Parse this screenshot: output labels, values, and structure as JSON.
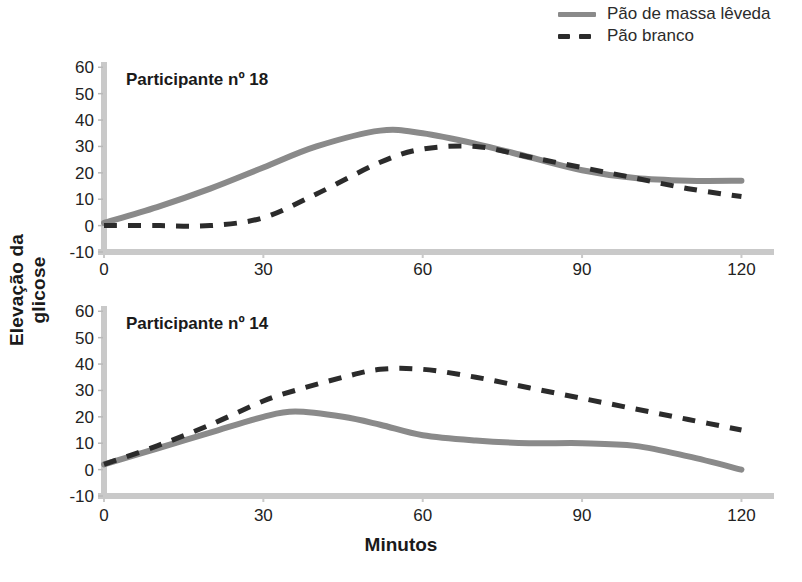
{
  "legend": {
    "position": "top-right",
    "items": [
      {
        "label": "Pão de massa lêveda",
        "style": "solid",
        "color": "#8a8a8a",
        "icon": "solid-line-swatch"
      },
      {
        "label": "Pão branco",
        "style": "dashed",
        "color": "#2b2b2b",
        "icon": "dashed-line-swatch"
      }
    ]
  },
  "axes": {
    "ylabel": "Elevação da glicose",
    "xlabel": "Minutos"
  },
  "chart_data": [
    {
      "type": "line",
      "title": "Participante nº 18",
      "xlabel": "Minutos",
      "ylabel": "Elevação da glicose",
      "xlim": [
        0,
        125
      ],
      "ylim": [
        -10,
        62
      ],
      "xticks": [
        0,
        30,
        60,
        90,
        120
      ],
      "yticks": [
        -10,
        0,
        10,
        20,
        30,
        40,
        50,
        60
      ],
      "grid": false,
      "legend": "top-right",
      "x": [
        0,
        10,
        20,
        30,
        40,
        52,
        60,
        70,
        80,
        90,
        100,
        110,
        120
      ],
      "series": [
        {
          "name": "Pão de massa lêveda",
          "style": "solid",
          "color": "#8a8a8a",
          "values": [
            1,
            7,
            14,
            22,
            30,
            36,
            35,
            31,
            26,
            21,
            18,
            17,
            17
          ]
        },
        {
          "name": "Pão branco",
          "style": "dashed",
          "color": "#2b2b2b",
          "values": [
            0,
            0,
            0,
            3,
            12,
            24,
            29,
            30,
            26,
            22,
            18,
            14,
            11
          ]
        }
      ]
    },
    {
      "type": "line",
      "title": "Participante nº 14",
      "xlabel": "Minutos",
      "ylabel": "Elevação da glicose",
      "xlim": [
        0,
        125
      ],
      "ylim": [
        -10,
        62
      ],
      "xticks": [
        0,
        30,
        60,
        90,
        120
      ],
      "yticks": [
        -10,
        0,
        10,
        20,
        30,
        40,
        50,
        60
      ],
      "grid": false,
      "legend": "top-right",
      "x": [
        0,
        10,
        20,
        30,
        36,
        45,
        52,
        60,
        70,
        80,
        90,
        100,
        110,
        120
      ],
      "series": [
        {
          "name": "Pão de massa lêveda",
          "style": "solid",
          "color": "#8a8a8a",
          "values": [
            2,
            8,
            14,
            20,
            22,
            20,
            17,
            13,
            11,
            10,
            10,
            9,
            5,
            0
          ]
        },
        {
          "name": "Pão branco",
          "style": "dashed",
          "color": "#2b2b2b",
          "values": [
            2,
            9,
            17,
            26,
            30,
            35,
            38,
            38,
            35,
            31,
            27,
            23,
            19,
            15
          ]
        }
      ]
    }
  ],
  "colors": {
    "solid_series": "#8a8a8a",
    "dashed_series": "#2b2b2b",
    "axis_line": "#c9c9c9",
    "text": "#1a1a1a"
  }
}
